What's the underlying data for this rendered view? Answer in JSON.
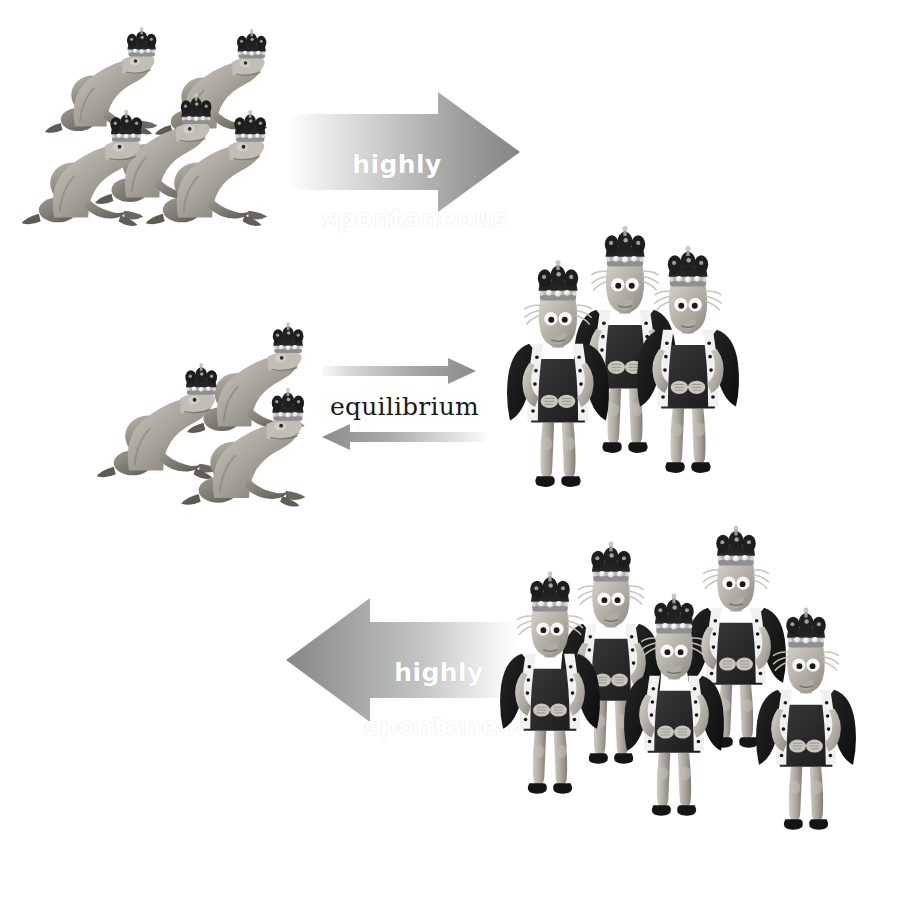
{
  "canvas": {
    "width": 918,
    "height": 906,
    "background": "#ffffff"
  },
  "diagram": {
    "arrows": [
      {
        "id": "top-arrow",
        "label": "highly\nspontaneous",
        "direction": "right",
        "thickness": "thick",
        "gradient_from": "#fdfdfd",
        "gradient_to": "#8a8a8a",
        "label_color": "#ffffff",
        "x": 288,
        "y": 92,
        "width": 230,
        "height": 118
      },
      {
        "id": "equilibrium-arrow-forward",
        "label": "",
        "direction": "right",
        "thickness": "thin",
        "gradient_from": "#f2f2f2",
        "gradient_to": "#8f8f8f",
        "label_color": "#1a1a1a",
        "x": 322,
        "y": 358,
        "width": 152,
        "height": 26
      },
      {
        "id": "equilibrium-arrow-reverse",
        "label": "",
        "direction": "left",
        "thickness": "thin",
        "gradient_from": "#8f8f8f",
        "gradient_to": "#fafafa",
        "label_color": "#1a1a1a",
        "x": 322,
        "y": 424,
        "width": 162,
        "height": 26
      },
      {
        "id": "bottom-arrow",
        "label": "highly\nspontaneous",
        "direction": "left",
        "thickness": "thick",
        "gradient_from": "#8a8a8a",
        "gradient_to": "#ffffff",
        "label_color": "#ffffff",
        "x": 286,
        "y": 598,
        "width": 232,
        "height": 122
      }
    ],
    "labels": {
      "top_arrow_line1": "highly",
      "top_arrow_line2": "spontaneous",
      "equilibrium": "equilibrium",
      "bottom_arrow_line1": "highly",
      "bottom_arrow_line2": "spontaneous"
    },
    "groups": [
      {
        "id": "frogs-top-left",
        "kind": "crowned-frogs",
        "count": 5,
        "label": "five crowned frogs",
        "x": 30,
        "y": 25,
        "width": 265,
        "height": 255
      },
      {
        "id": "frogs-middle-left",
        "kind": "crowned-frogs",
        "count": 3,
        "label": "three crowned frogs",
        "x": 105,
        "y": 322,
        "width": 210,
        "height": 215
      },
      {
        "id": "kings-middle-right",
        "kind": "crowned-kings",
        "count": 3,
        "label": "three crowned kings",
        "x": 492,
        "y": 242,
        "width": 250,
        "height": 300
      },
      {
        "id": "kings-bottom-right",
        "kind": "crowned-kings",
        "count": 5,
        "label": "five crowned kings",
        "x": 468,
        "y": 540,
        "width": 440,
        "height": 330
      }
    ],
    "palette": {
      "frog_body_light": "#d9d6cf",
      "frog_body_mid": "#a8a49c",
      "frog_body_dark": "#6f6c66",
      "crown_dark": "#2b2b2b",
      "crown_band": "#9a9a9a",
      "crown_pearl": "#f4f4f2",
      "king_skin_light": "#cfccc4",
      "king_skin_mid": "#a5a199",
      "robe_black": "#1d1d1d",
      "ermine_white": "#f3f3f1",
      "ermine_spot": "#161616",
      "tunic": "#2a2a2a",
      "shoe": "#151515",
      "eye_white": "#f7f7f5",
      "eye_pupil": "#1a1a1a"
    }
  }
}
